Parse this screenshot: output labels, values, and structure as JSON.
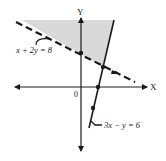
{
  "diagram": {
    "type": "linear-inequality-graph",
    "axes": {
      "x_label": "X",
      "y_label": "Y",
      "origin_label": "0"
    },
    "lines": [
      {
        "equation": "x + 2y = 8",
        "style": "dashed",
        "label": "x + 2y = 8"
      },
      {
        "equation": "3x − y = 6",
        "style": "solid",
        "label": "3x − y = 6"
      }
    ],
    "shaded_region": {
      "description": "region above dashed line and left of solid line",
      "color": "#d9d9d9"
    },
    "colors": {
      "ink": "#1a1a1a",
      "shade": "#d9d9d9",
      "background": "#ffffff"
    }
  }
}
